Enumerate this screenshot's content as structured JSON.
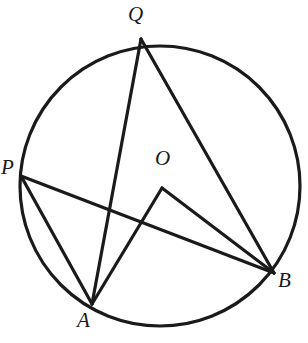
{
  "figure": {
    "type": "circle-geometry-diagram",
    "canvas": {
      "width": 308,
      "height": 343,
      "background": "#ffffff"
    },
    "stroke_color": "#1a1a1a",
    "circle": {
      "name": "main-circle",
      "cx": 160,
      "cy": 186,
      "r": 140,
      "stroke_width": 3.2
    },
    "points": [
      {
        "id": "Q",
        "label": "Q",
        "x": 141,
        "y": 39,
        "label_x": 128,
        "label_y": 4,
        "on_circle": true
      },
      {
        "id": "P",
        "label": "P",
        "x": 21,
        "y": 176,
        "label_x": 1,
        "label_y": 157,
        "on_circle": true
      },
      {
        "id": "O",
        "label": "O",
        "x": 162,
        "y": 188,
        "label_x": 155,
        "label_y": 148,
        "on_circle": false
      },
      {
        "id": "B",
        "label": "B",
        "x": 274,
        "y": 273,
        "label_x": 278,
        "label_y": 270,
        "on_circle": true
      },
      {
        "id": "A",
        "label": "A",
        "x": 92,
        "y": 304,
        "label_x": 77,
        "label_y": 310,
        "on_circle": true
      }
    ],
    "segments": [
      {
        "id": "QA",
        "from": "Q",
        "to": "A",
        "x1": 141,
        "y1": 39,
        "x2": 92,
        "y2": 304,
        "stroke_width": 3.2
      },
      {
        "id": "QB",
        "from": "Q",
        "to": "B",
        "x1": 141,
        "y1": 39,
        "x2": 274,
        "y2": 273,
        "stroke_width": 3.2
      },
      {
        "id": "PA",
        "from": "P",
        "to": "A",
        "x1": 21,
        "y1": 176,
        "x2": 92,
        "y2": 304,
        "stroke_width": 3.2
      },
      {
        "id": "PB",
        "from": "P",
        "to": "B",
        "x1": 21,
        "y1": 176,
        "x2": 274,
        "y2": 273,
        "stroke_width": 3.2
      },
      {
        "id": "OA",
        "from": "O",
        "to": "A",
        "x1": 162,
        "y1": 188,
        "x2": 92,
        "y2": 304,
        "stroke_width": 3.2
      },
      {
        "id": "OB",
        "from": "O",
        "to": "B",
        "x1": 162,
        "y1": 188,
        "x2": 274,
        "y2": 273,
        "stroke_width": 3.2
      }
    ]
  }
}
